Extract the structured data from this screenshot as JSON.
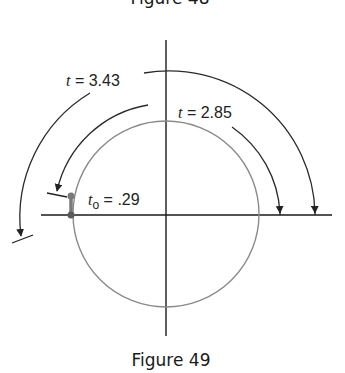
{
  "captions": {
    "top": "Figure 48",
    "bottom": "Figure 49"
  },
  "labels": {
    "t_outer": {
      "var": "t",
      "eq": " = 3.43"
    },
    "t_middle": {
      "var": "t",
      "eq": " = 2.85"
    },
    "t_zero": {
      "var": "t",
      "sub": "o",
      "eq": " = .29"
    }
  },
  "colors": {
    "axis": "#1a1a1a",
    "circle": "#8a8a8a",
    "arc": "#2a2a2a",
    "marker": "#7a7a7a"
  }
}
